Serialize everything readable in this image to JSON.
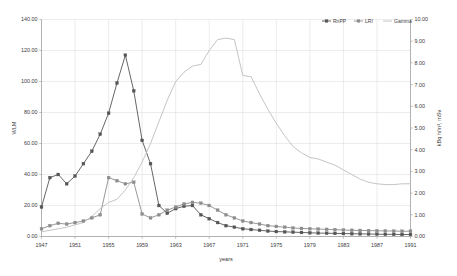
{
  "chart_data": {
    "type": "line",
    "title": "",
    "xlabel": "years",
    "ylabel": "WLM",
    "y2label": "kBq h/m³, mSv",
    "xlim": [
      1947,
      1991
    ],
    "ylim": [
      0.0,
      140.0
    ],
    "y2lim": [
      0.0,
      10.0
    ],
    "grid": true,
    "legend_position": "top-right",
    "x": [
      1947,
      1948,
      1949,
      1950,
      1951,
      1952,
      1953,
      1954,
      1955,
      1956,
      1957,
      1958,
      1959,
      1960,
      1961,
      1962,
      1963,
      1964,
      1965,
      1966,
      1967,
      1968,
      1969,
      1970,
      1971,
      1972,
      1973,
      1974,
      1975,
      1976,
      1977,
      1978,
      1979,
      1980,
      1981,
      1982,
      1983,
      1984,
      1985,
      1986,
      1987,
      1988,
      1989,
      1990,
      1991
    ],
    "xticks": [
      1947,
      1951,
      1955,
      1959,
      1963,
      1967,
      1971,
      1975,
      1979,
      1983,
      1987,
      1991
    ],
    "xticklabels": [
      "1947",
      "1951",
      "1955",
      "1959",
      "1963",
      "1967",
      "1971",
      "1975",
      "1979",
      "1983",
      "1987",
      "1991"
    ],
    "yticks": [
      0.0,
      20.0,
      40.0,
      60.0,
      80.0,
      100.0,
      120.0,
      140.0
    ],
    "yticklabels": [
      "0.00",
      "20.00",
      "40.00",
      "60.00",
      "80.00",
      "100.00",
      "120.00",
      "140.00"
    ],
    "y2ticks": [
      0.0,
      1.0,
      2.0,
      3.0,
      4.0,
      5.0,
      6.0,
      7.0,
      8.0,
      9.0,
      10.0
    ],
    "y2ticklabels": [
      "0.00",
      "1.00",
      "2.00",
      "3.00",
      "4.00",
      "5.00",
      "6.00",
      "7.00",
      "8.00",
      "9.00",
      "10.00"
    ],
    "series": [
      {
        "name": "RnPP",
        "axis": "left",
        "color": "#555555",
        "marker": "square",
        "values": [
          19.0,
          38.0,
          40.0,
          34.0,
          39.0,
          47.0,
          55.0,
          66.0,
          79.5,
          99.0,
          117.0,
          94.0,
          62.0,
          47.0,
          20.0,
          15.0,
          18.0,
          19.5,
          20.0,
          14.0,
          11.5,
          9.0,
          7.0,
          6.0,
          5.0,
          4.5,
          4.0,
          3.5,
          3.2,
          3.0,
          2.8,
          2.6,
          2.4,
          2.2,
          2.1,
          2.0,
          1.9,
          1.8,
          1.7,
          1.6,
          1.5,
          1.4,
          1.4,
          1.3,
          1.3
        ]
      },
      {
        "name": "LRI",
        "axis": "left",
        "color": "#8c8c8c",
        "marker": "square",
        "values": [
          5.0,
          7.0,
          8.5,
          8.0,
          9.0,
          10.0,
          12.0,
          14.0,
          38.0,
          36.0,
          34.0,
          35.0,
          14.5,
          12.0,
          14.0,
          17.0,
          19.0,
          21.0,
          22.0,
          21.5,
          20.0,
          17.0,
          14.0,
          12.0,
          10.0,
          9.0,
          8.0,
          7.0,
          6.5,
          6.0,
          5.5,
          5.2,
          5.0,
          4.8,
          4.6,
          4.4,
          4.2,
          4.0,
          3.9,
          3.8,
          3.7,
          3.6,
          3.5,
          3.4,
          3.4
        ]
      },
      {
        "name": "Gamma",
        "axis": "left",
        "color": "#bdbdbd",
        "marker": "none",
        "values": [
          3.0,
          4.0,
          5.0,
          6.0,
          7.5,
          9.0,
          13.0,
          18.0,
          22.0,
          24.0,
          30.0,
          38.0,
          48.0,
          60.0,
          74.0,
          88.0,
          100.0,
          106.0,
          110.0,
          111.0,
          120.0,
          127.0,
          128.0,
          127.0,
          104.0,
          103.0,
          92.0,
          82.0,
          73.0,
          65.0,
          58.0,
          54.0,
          51.0,
          50.0,
          48.0,
          46.0,
          43.0,
          40.0,
          37.0,
          35.0,
          34.0,
          33.5,
          33.5,
          34.0,
          34.0
        ]
      }
    ]
  },
  "legend": {
    "items": [
      {
        "label": "RnPP",
        "color": "#555555"
      },
      {
        "label": "LRI",
        "color": "#8c8c8c"
      },
      {
        "label": "Gamma",
        "color": "#bdbdbd"
      }
    ]
  }
}
